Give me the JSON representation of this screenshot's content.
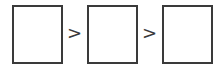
{
  "diagram": {
    "boxes": [
      {
        "label": ""
      },
      {
        "label": ""
      },
      {
        "label": ""
      }
    ],
    "separators": [
      ">",
      ">"
    ],
    "stroke_color": "#3a3a3a"
  }
}
